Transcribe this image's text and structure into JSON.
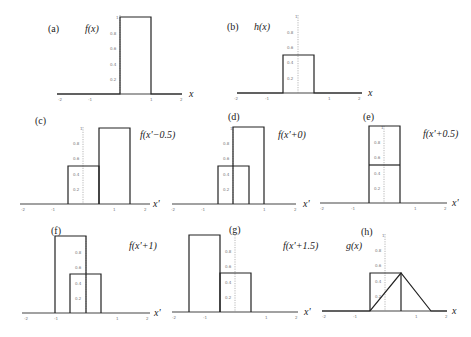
{
  "figure": {
    "panels": [
      {
        "id": "a",
        "label": "(a)",
        "title": "f(x)",
        "xlabel": "x",
        "x_ticks": [
          "-2",
          "-1",
          "1",
          "2"
        ],
        "y_ticks": [
          "0.2",
          "0.4",
          "0.6",
          "0.8",
          "1"
        ],
        "description": "Rectangle pulse height 1 on [0,1]"
      },
      {
        "id": "b",
        "label": "(b)",
        "title": "h(x)",
        "xlabel": "x",
        "x_ticks": [
          "-2",
          "-1",
          "1",
          "2"
        ],
        "y_ticks": [
          "0.2",
          "0.4",
          "0.6",
          "0.8",
          "1"
        ],
        "description": "Rectangle pulse height 0.5 on [-0.5,0.5]"
      },
      {
        "id": "c",
        "label": "(c)",
        "title": "f(x'−0.5)",
        "xlabel": "x'",
        "x_ticks": [
          "-2",
          "-1",
          "1",
          "2"
        ],
        "y_ticks": [
          "0.2",
          "0.4",
          "0.6",
          "0.8",
          "1"
        ],
        "description": "h on [-0.5,0.5] and f shifted to [0.5,1.5]"
      },
      {
        "id": "d",
        "label": "(d)",
        "title": "f(x'+0)",
        "xlabel": "x'",
        "x_ticks": [
          "-2",
          "-1",
          "1",
          "2"
        ],
        "y_ticks": [
          "0.2",
          "0.4",
          "0.6",
          "0.8",
          "1"
        ],
        "description": "h on [-0.5,0.5] and f on [0,1]"
      },
      {
        "id": "e",
        "label": "(e)",
        "title": "f(x'+0.5)",
        "xlabel": "x'",
        "x_ticks": [
          "-2",
          "-1",
          "1",
          "2"
        ],
        "y_ticks": [
          "0.2",
          "0.4",
          "0.6",
          "0.8",
          "1"
        ],
        "description": "h on [-0.5,0.5] and f on [-0.5,0.5] (full overlap)"
      },
      {
        "id": "f",
        "label": "(f)",
        "title": "f(x'+1)",
        "xlabel": "x'",
        "x_ticks": [
          "-2",
          "-1",
          "1",
          "2"
        ],
        "y_ticks": [
          "0.2",
          "0.4",
          "0.6",
          "0.8",
          "1"
        ],
        "description": "h on [-0.5,0.5] and f on [-1,0]"
      },
      {
        "id": "g",
        "label": "(g)",
        "title": "f(x'+1.5)",
        "xlabel": "x'",
        "x_ticks": [
          "-2",
          "-1",
          "1",
          "2"
        ],
        "y_ticks": [
          "0.2",
          "0.4",
          "0.6",
          "0.8",
          "1"
        ],
        "description": "h on [-0.5,0.5] and f on [-1.5,-0.5]"
      },
      {
        "id": "h",
        "label": "(h)",
        "title": "g(x)",
        "xlabel": "x",
        "x_ticks": [
          "-2",
          "-1",
          "1",
          "2"
        ],
        "y_ticks": [
          "0.2",
          "0.4",
          "0.6",
          "0.8",
          "1"
        ],
        "description": "h rectangle and triangular convolution result from -0.5 to 1.5 peak 0.5 at 0.5"
      }
    ]
  }
}
